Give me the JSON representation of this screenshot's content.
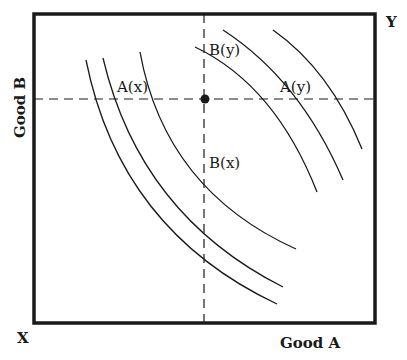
{
  "diagram": {
    "type": "edgeworth-box",
    "axis_labels": {
      "horizontal": "Good A",
      "vertical": "Good B"
    },
    "corner_labels": {
      "origin_x": "X",
      "origin_y": "Y"
    },
    "curve_labels": {
      "ax": "A(x)",
      "bx": "B(x)",
      "ay": "A(y)",
      "by": "B(y)"
    },
    "colors": {
      "line": "#1a1a1a",
      "background": "#ffffff"
    },
    "box": {
      "left": 34,
      "top": 14,
      "right": 375,
      "bottom": 323
    },
    "endowment_point": {
      "x": 205,
      "y": 99
    },
    "x_curves": [
      {
        "start": [
          86,
          60
        ],
        "control": [
          120,
          230
        ],
        "end": [
          277,
          304
        ]
      },
      {
        "start": [
          103,
          58
        ],
        "control": [
          140,
          215
        ],
        "end": [
          283,
          287
        ]
      },
      {
        "start": [
          140,
          52
        ],
        "control": [
          165,
          190
        ],
        "end": [
          296,
          249
        ]
      }
    ],
    "y_curves": [
      {
        "start": [
          195,
          47
        ],
        "control": [
          275,
          85
        ],
        "end": [
          317,
          192
        ]
      },
      {
        "start": [
          223,
          30
        ],
        "control": [
          300,
          80
        ],
        "end": [
          343,
          180
        ]
      },
      {
        "start": [
          273,
          30
        ],
        "control": [
          330,
          70
        ],
        "end": [
          362,
          149
        ]
      }
    ]
  }
}
